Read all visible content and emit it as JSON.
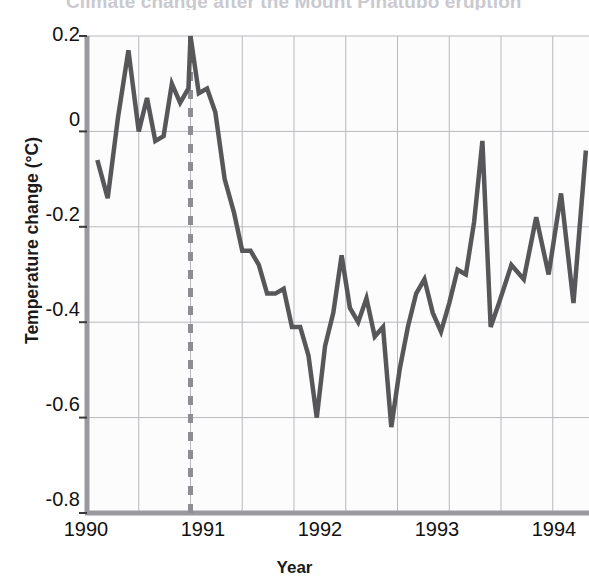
{
  "figure": {
    "title": "Climate change after the Mount Pinatubo eruption",
    "background": "#ffffff"
  },
  "axes": {
    "ylabel": "Temperature change (°C)",
    "xlabel": "Year",
    "yticks": [
      "0.2",
      "0",
      "-0.2",
      "-0.4",
      "-0.6",
      "-0.8"
    ],
    "xticks": [
      "1990",
      "1991",
      "1992",
      "1993",
      "1994"
    ]
  },
  "annotation": {
    "line1": "Time of",
    "line2": "Pinatubo",
    "line3": "eruption"
  },
  "colors": {
    "line": "#57575a",
    "marker_line": "#8e8e92",
    "grid": "#b9b9bd",
    "axis": "#9a9a9e",
    "text": "#111111",
    "title": "#c9c9cf"
  },
  "chart_data": {
    "type": "line",
    "title": "Climate change after the Mount Pinatubo eruption",
    "xlabel": "Year",
    "ylabel": "Temperature change (°C)",
    "xlim": [
      1990.0,
      1994.85
    ],
    "ylim": [
      -0.8,
      0.2
    ],
    "grid": true,
    "legend": null,
    "annotations": [
      {
        "text": "Time of Pinatubo eruption",
        "x": 1991.0,
        "style": "dashed vertical line",
        "color": "#8e8e92"
      }
    ],
    "series": [
      {
        "name": "Global temperature anomaly",
        "x": [
          1990.1,
          1990.2,
          1990.3,
          1990.4,
          1990.5,
          1990.58,
          1990.66,
          1990.74,
          1990.82,
          1990.9,
          1990.98,
          1991.0,
          1991.08,
          1991.16,
          1991.24,
          1991.33,
          1991.42,
          1991.5,
          1991.58,
          1991.66,
          1991.74,
          1991.82,
          1991.9,
          1991.98,
          1992.06,
          1992.14,
          1992.22,
          1992.3,
          1992.38,
          1992.46,
          1992.54,
          1992.62,
          1992.7,
          1992.78,
          1992.86,
          1992.94,
          1993.02,
          1993.1,
          1993.18,
          1993.26,
          1993.34,
          1993.42,
          1993.5,
          1993.58,
          1993.66,
          1993.74,
          1993.82,
          1993.9,
          1993.98,
          1994.1,
          1994.22,
          1994.34,
          1994.46,
          1994.58,
          1994.7,
          1994.82
        ],
        "y": [
          -0.06,
          -0.14,
          0.03,
          0.17,
          0.0,
          0.07,
          -0.02,
          -0.01,
          0.1,
          0.06,
          0.09,
          0.2,
          0.08,
          0.09,
          0.04,
          -0.1,
          -0.17,
          -0.25,
          -0.25,
          -0.28,
          -0.34,
          -0.34,
          -0.33,
          -0.41,
          -0.41,
          -0.47,
          -0.6,
          -0.45,
          -0.38,
          -0.26,
          -0.37,
          -0.4,
          -0.35,
          -0.43,
          -0.41,
          -0.62,
          -0.5,
          -0.41,
          -0.34,
          -0.31,
          -0.38,
          -0.42,
          -0.36,
          -0.29,
          -0.3,
          -0.19,
          -0.02,
          -0.41,
          -0.36,
          -0.28,
          -0.31,
          -0.18,
          -0.3,
          -0.13,
          -0.36,
          -0.04
        ]
      }
    ]
  }
}
